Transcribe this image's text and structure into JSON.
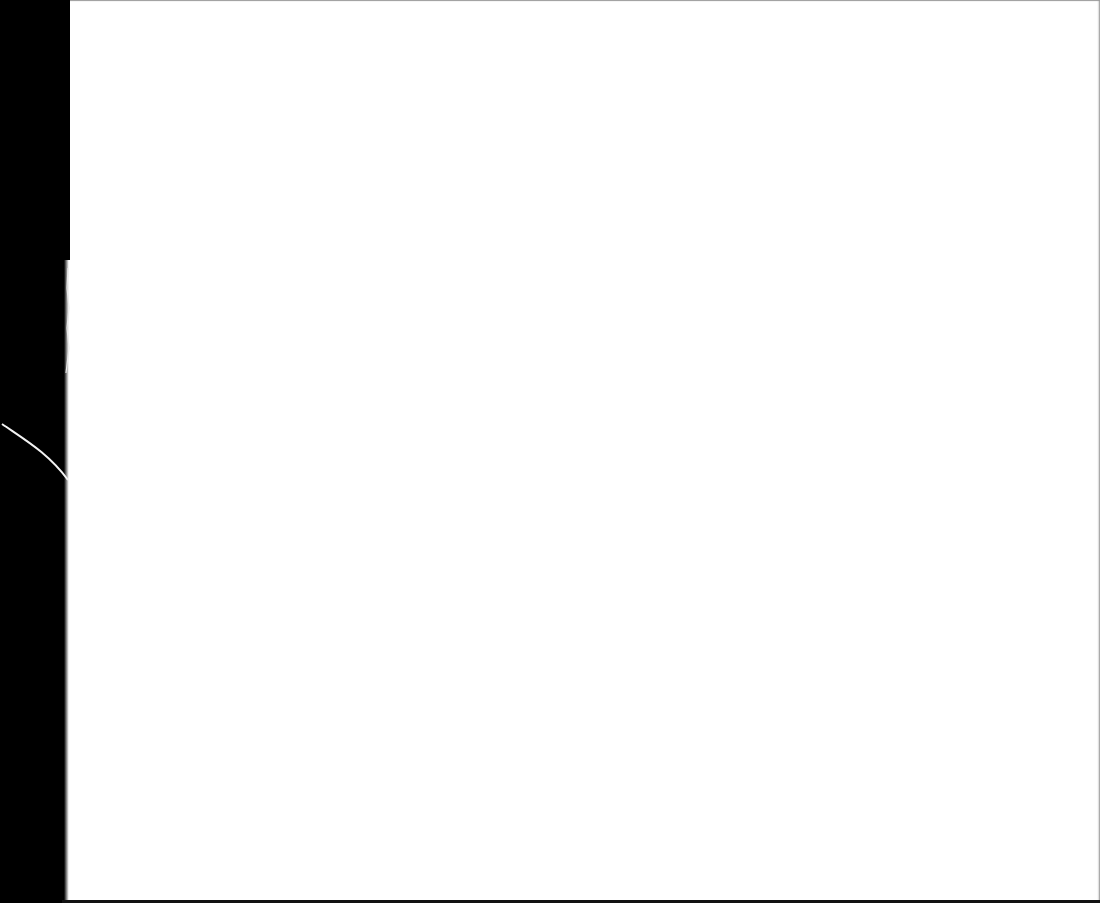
{
  "scene": {
    "description": "Blank white sheet of paper photographed against a black background",
    "colors": {
      "background": "#000000",
      "paper": "#ffffff",
      "paper_edge_shadow": "#9a9a9a",
      "fiber": "#f2f2f2"
    },
    "text": ""
  }
}
